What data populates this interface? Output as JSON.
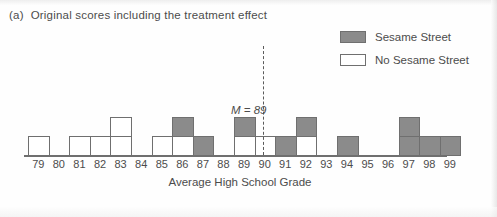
{
  "panel": {
    "label": "(a)",
    "title": "Original scores including the treatment effect"
  },
  "legend": {
    "items": [
      {
        "label": "Sesame Street",
        "style": "filled",
        "color": "#8b8b8b"
      },
      {
        "label": "No Sesame Street",
        "style": "hollow",
        "color": "#ffffff"
      }
    ]
  },
  "annotation": {
    "mean_label": "M = 89",
    "mean_symbol": "M",
    "mean_equals": " = ",
    "mean_value": "89"
  },
  "axis": {
    "xlabel": "Average High School Grade",
    "ticks": [
      "79",
      "80",
      "81",
      "82",
      "83",
      "84",
      "85",
      "86",
      "87",
      "88",
      "89",
      "90",
      "91",
      "92",
      "93",
      "94",
      "95",
      "96",
      "97",
      "98",
      "99"
    ]
  },
  "colors": {
    "sesame_fill": "#8b8b8b",
    "no_sesame_fill": "#ffffff",
    "outline": "#6f6f6f",
    "text": "#4c4c4c"
  },
  "chart_data": {
    "type": "bar",
    "title": "Original scores including the treatment effect",
    "xlabel": "Average High School Grade",
    "ylabel": "",
    "xlim": [
      79,
      99
    ],
    "ylim": [
      0,
      3
    ],
    "grid": false,
    "legend_position": "top-right",
    "stacked": true,
    "block_unit": 1,
    "annotations": [
      {
        "text": "M = 89",
        "x": 89,
        "type": "vertical-dashed-line"
      }
    ],
    "categories": [
      "79",
      "80",
      "81",
      "82",
      "83",
      "84",
      "85",
      "86",
      "87",
      "88",
      "89",
      "90",
      "91",
      "92",
      "93",
      "94",
      "95",
      "96",
      "97",
      "98",
      "99"
    ],
    "series": [
      {
        "name": "No Sesame Street",
        "color": "#ffffff",
        "values": [
          1,
          0,
          1,
          1,
          2,
          0,
          1,
          1,
          0,
          0,
          1,
          1,
          0,
          1,
          0,
          0,
          0,
          0,
          0,
          0,
          0
        ]
      },
      {
        "name": "Sesame Street",
        "color": "#8b8b8b",
        "values": [
          0,
          0,
          0,
          0,
          0,
          0,
          0,
          1,
          1,
          0,
          1,
          0,
          1,
          1,
          0,
          1,
          0,
          0,
          2,
          1,
          1
        ]
      }
    ],
    "columns": [
      {
        "x": "79",
        "stack": [
          "white"
        ]
      },
      {
        "x": "80",
        "stack": []
      },
      {
        "x": "81",
        "stack": [
          "white"
        ]
      },
      {
        "x": "82",
        "stack": [
          "white"
        ]
      },
      {
        "x": "83",
        "stack": [
          "white",
          "white"
        ]
      },
      {
        "x": "84",
        "stack": []
      },
      {
        "x": "85",
        "stack": [
          "white"
        ]
      },
      {
        "x": "86",
        "stack": [
          "white",
          "gray"
        ]
      },
      {
        "x": "87",
        "stack": [
          "gray"
        ]
      },
      {
        "x": "88",
        "stack": []
      },
      {
        "x": "89",
        "stack": [
          "white",
          "gray"
        ]
      },
      {
        "x": "90",
        "stack": [
          "white"
        ]
      },
      {
        "x": "91",
        "stack": [
          "gray"
        ]
      },
      {
        "x": "92",
        "stack": [
          "white",
          "gray"
        ]
      },
      {
        "x": "93",
        "stack": []
      },
      {
        "x": "94",
        "stack": [
          "gray"
        ]
      },
      {
        "x": "95",
        "stack": []
      },
      {
        "x": "96",
        "stack": []
      },
      {
        "x": "97",
        "stack": [
          "gray",
          "gray"
        ]
      },
      {
        "x": "98",
        "stack": [
          "gray"
        ]
      },
      {
        "x": "99",
        "stack": [
          "gray"
        ]
      }
    ]
  }
}
